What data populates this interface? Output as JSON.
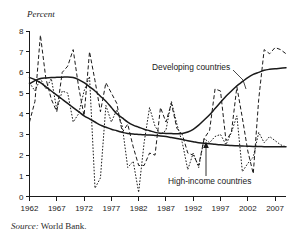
{
  "figure": {
    "y_axis_title": "Percent",
    "source_lead": "Source:",
    "source_text": "World Bank."
  },
  "chart_data": {
    "type": "line",
    "title": "",
    "subtitle": "",
    "xlabel": "",
    "ylabel": "Percent",
    "xlim": [
      1962,
      2009
    ],
    "ylim": [
      0,
      8
    ],
    "grid": false,
    "legend_position": "inline-annotations",
    "yticks": [
      0,
      1,
      2,
      3,
      4,
      5,
      6,
      7,
      8
    ],
    "ytick_labels": [
      "0",
      "1",
      "2",
      "3",
      "4",
      "5",
      "6",
      "7",
      "8"
    ],
    "xticks": [
      1962,
      1967,
      1972,
      1977,
      1982,
      1987,
      1992,
      1997,
      2002,
      2007
    ],
    "xtick_labels": [
      "1962",
      "1967",
      "1972",
      "1977",
      "1982",
      "1987",
      "1992",
      "1997",
      "2002",
      "2007"
    ],
    "annotations": [
      {
        "text": "Developing countries",
        "x": 1990,
        "y": 6.0
      },
      {
        "text": "High-income countries",
        "x": 1998,
        "y": 0.85
      }
    ],
    "x": [
      1962,
      1963,
      1964,
      1965,
      1966,
      1967,
      1968,
      1969,
      1970,
      1971,
      1972,
      1973,
      1974,
      1975,
      1976,
      1977,
      1978,
      1979,
      1980,
      1981,
      1982,
      1983,
      1984,
      1985,
      1986,
      1987,
      1988,
      1989,
      1990,
      1991,
      1992,
      1993,
      1994,
      1995,
      1996,
      1997,
      1998,
      1999,
      2000,
      2001,
      2002,
      2003,
      2004,
      2005,
      2006,
      2007,
      2008,
      2009
    ],
    "series": [
      {
        "name": "Developing countries",
        "style": "dashed",
        "values": [
          3.6,
          4.6,
          7.8,
          5.7,
          4.7,
          4.1,
          6.0,
          6.3,
          7.1,
          5.3,
          3.9,
          7.0,
          5.6,
          4.1,
          5.5,
          5.0,
          4.5,
          3.1,
          3.5,
          2.4,
          1.5,
          1.5,
          2.1,
          2.0,
          4.3,
          3.6,
          4.5,
          3.3,
          3.0,
          2.1,
          2.0,
          1.5,
          2.8,
          3.2,
          5.2,
          5.1,
          2.7,
          3.1,
          5.3,
          3.8,
          2.2,
          1.1,
          4.7,
          7.1,
          6.9,
          7.2,
          7.1,
          6.9
        ]
      },
      {
        "name": "Developing countries trend",
        "style": "solid-smooth",
        "values": [
          5.45,
          5.6,
          5.7,
          5.73,
          5.75,
          5.76,
          5.77,
          5.78,
          5.75,
          5.65,
          5.5,
          5.3,
          5.1,
          4.85,
          4.6,
          4.3,
          4.0,
          3.8,
          3.6,
          3.45,
          3.35,
          3.25,
          3.18,
          3.1,
          3.06,
          3.05,
          3.04,
          3.03,
          3.05,
          3.12,
          3.25,
          3.45,
          3.7,
          3.95,
          4.25,
          4.55,
          4.85,
          5.1,
          5.35,
          5.55,
          5.75,
          5.9,
          6.0,
          6.1,
          6.15,
          6.18,
          6.2,
          6.22
        ]
      },
      {
        "name": "High-income countries",
        "style": "dotted",
        "values": [
          5.5,
          5.1,
          5.7,
          5.2,
          5.7,
          4.2,
          5.1,
          5.0,
          3.6,
          4.0,
          5.1,
          5.8,
          0.4,
          0.9,
          4.4,
          3.6,
          4.2,
          3.4,
          1.4,
          1.7,
          0.2,
          2.6,
          4.3,
          3.4,
          3.0,
          3.2,
          4.6,
          3.5,
          2.6,
          1.3,
          2.1,
          1.4,
          2.8,
          2.6,
          2.9,
          3.0,
          2.5,
          3.1,
          3.9,
          1.2,
          1.6,
          1.9,
          3.1,
          2.6,
          2.9,
          2.7,
          2.5,
          2.4
        ]
      },
      {
        "name": "High-income countries trend",
        "style": "solid-smooth",
        "values": [
          5.75,
          5.65,
          5.5,
          5.3,
          5.1,
          4.9,
          4.7,
          4.5,
          4.3,
          4.1,
          3.9,
          3.75,
          3.6,
          3.45,
          3.35,
          3.25,
          3.18,
          3.1,
          3.05,
          3.02,
          3.0,
          2.98,
          2.97,
          2.95,
          2.93,
          2.9,
          2.85,
          2.8,
          2.75,
          2.7,
          2.65,
          2.6,
          2.57,
          2.55,
          2.52,
          2.5,
          2.48,
          2.46,
          2.45,
          2.44,
          2.43,
          2.42,
          2.42,
          2.41,
          2.41,
          2.4,
          2.4,
          2.4
        ]
      }
    ]
  }
}
